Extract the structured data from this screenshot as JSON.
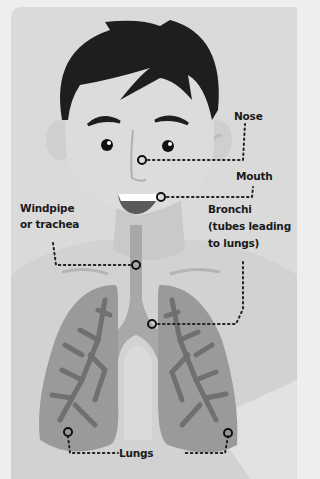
{
  "diagram": {
    "labels": {
      "nose": "Nose",
      "mouth": "Mouth",
      "windpipe_line1": "Windpipe",
      "windpipe_line2": "or trachea",
      "bronchi_line1": "Bronchi",
      "bronchi_line2": "(tubes leading",
      "bronchi_line3": "to lungs)",
      "lungs": "Lungs"
    },
    "colors": {
      "background": "#eeeeee",
      "panel": "#dadada",
      "skin": "#cfcfcf",
      "hair": "#1e1e1e",
      "lung": "#9a9a9a",
      "bronchiole": "#707070",
      "trachea": "#a8a8a8",
      "text": "#1a1a1a"
    }
  }
}
